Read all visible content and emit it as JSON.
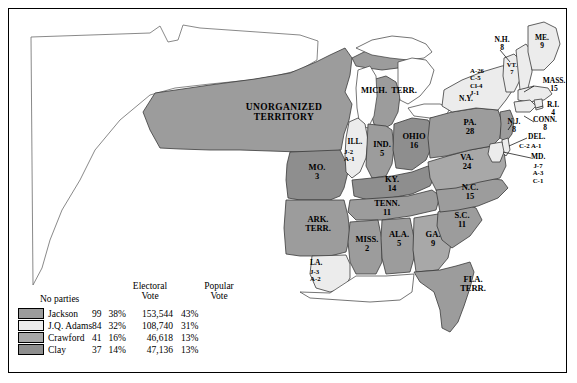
{
  "map": {
    "title": "1824 Presidential Election electoral vote map",
    "colors": {
      "jackson": "#9c9c9c",
      "adams": "#ececec",
      "crawford": "#a8a8a8",
      "clay": "#8e8e8e",
      "unorganized": "#9c9c9c",
      "water": "#ffffff",
      "outline": "#000000"
    },
    "territories": [
      {
        "name": "UNORGANIZED TERRITORY",
        "line1": "UNORGANIZED",
        "line2": "TERRITORY"
      },
      {
        "name": "MICH. TERR.",
        "line1": "MICH.",
        "line2": "TERR."
      },
      {
        "name": "ARK. TERR.",
        "line1": "ARK.",
        "line2": "TERR."
      },
      {
        "name": "FLA. TERR.",
        "line1": "FLA.",
        "line2": "TERR."
      }
    ],
    "states": [
      {
        "abbr": "ME.",
        "votes": "9",
        "party": "adams"
      },
      {
        "abbr": "N.H.",
        "votes": "8",
        "party": "adams"
      },
      {
        "abbr": "VT.",
        "votes": "7",
        "party": "adams"
      },
      {
        "abbr": "MASS.",
        "votes": "15",
        "party": "adams"
      },
      {
        "abbr": "R.I.",
        "votes": "4",
        "party": "adams"
      },
      {
        "abbr": "CONN.",
        "votes": "8",
        "party": "adams"
      },
      {
        "abbr": "N.Y.",
        "votes": "",
        "party": "split"
      },
      {
        "abbr": "N.J.",
        "votes": "8",
        "party": "jackson"
      },
      {
        "abbr": "PA.",
        "votes": "28",
        "party": "jackson"
      },
      {
        "abbr": "DEL.",
        "votes": "",
        "party": "split"
      },
      {
        "abbr": "MD.",
        "votes": "",
        "party": "split"
      },
      {
        "abbr": "VA.",
        "votes": "24",
        "party": "crawford"
      },
      {
        "abbr": "OHIO",
        "votes": "16",
        "party": "clay"
      },
      {
        "abbr": "IND.",
        "votes": "5",
        "party": "jackson"
      },
      {
        "abbr": "ILL.",
        "votes": "",
        "party": "split"
      },
      {
        "abbr": "KY.",
        "votes": "14",
        "party": "clay"
      },
      {
        "abbr": "TENN.",
        "votes": "11",
        "party": "jackson"
      },
      {
        "abbr": "MO.",
        "votes": "3",
        "party": "clay"
      },
      {
        "abbr": "MISS.",
        "votes": "2",
        "party": "jackson"
      },
      {
        "abbr": "ALA.",
        "votes": "5",
        "party": "jackson"
      },
      {
        "abbr": "LA.",
        "votes": "",
        "party": "split"
      },
      {
        "abbr": "GA.",
        "votes": "9",
        "party": "crawford"
      },
      {
        "abbr": "S.C.",
        "votes": "11",
        "party": "jackson"
      },
      {
        "abbr": "N.C.",
        "votes": "15",
        "party": "jackson"
      }
    ],
    "split_labels": {
      "new_york": [
        "A-26",
        "C-5",
        "Cl-4",
        "J-1"
      ],
      "illinois": [
        "J-2",
        "A-1"
      ],
      "louisiana": [
        "J-3",
        "A-2"
      ],
      "delaware": [
        "C-2 A-1"
      ],
      "maryland": [
        "J-7",
        "A-3",
        "C-1"
      ]
    }
  },
  "legend": {
    "title": "No parties",
    "header_electoral_line1": "Electoral",
    "header_electoral_line2": "Vote",
    "header_popular_line1": "Popular",
    "header_popular_line2": "Vote",
    "rows": [
      {
        "candidate": "Jackson",
        "electoral": "99",
        "electoral_pct": "38%",
        "popular": "153,544",
        "popular_pct": "43%",
        "swatch": "#9c9c9c"
      },
      {
        "candidate": "J.Q. Adams",
        "electoral": "84",
        "electoral_pct": "32%",
        "popular": "108,740",
        "popular_pct": "31%",
        "swatch": "#ececec"
      },
      {
        "candidate": "Crawford",
        "electoral": "41",
        "electoral_pct": "16%",
        "popular": "46,618",
        "popular_pct": "13%",
        "swatch": "#a8a8a8"
      },
      {
        "candidate": "Clay",
        "electoral": "37",
        "electoral_pct": "14%",
        "popular": "47,136",
        "popular_pct": "13%",
        "swatch": "#8e8e8e"
      }
    ]
  }
}
